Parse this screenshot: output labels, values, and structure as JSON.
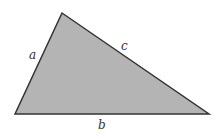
{
  "diagram": {
    "type": "triangle",
    "fill_color": "#b4b4b4",
    "stroke_color": "#333333",
    "vertices": {
      "top": [
        62,
        13
      ],
      "bottom_left": [
        15,
        114
      ],
      "bottom_right": [
        209,
        114
      ]
    },
    "sides": [
      {
        "name": "a",
        "label": "a"
      },
      {
        "name": "b",
        "label": "b"
      },
      {
        "name": "c",
        "label": "c"
      }
    ]
  }
}
